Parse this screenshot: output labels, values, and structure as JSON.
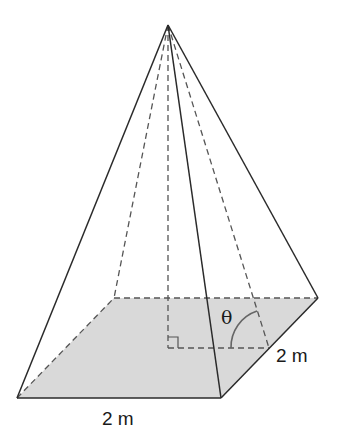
{
  "diagram": {
    "type": "square-based pyramid",
    "labels": {
      "base_front": "2 m",
      "base_side": "2 m",
      "angle": "θ"
    },
    "colors": {
      "base_fill": "#d9d9d9",
      "solid_line": "#2a2a2a",
      "dashed_line": "#555555",
      "angle_arc": "#666666"
    }
  }
}
